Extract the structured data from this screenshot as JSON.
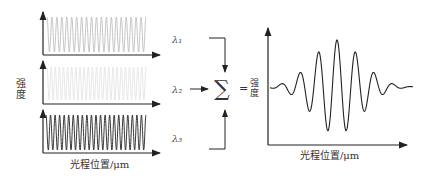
{
  "left_panels": {
    "y_label": "强度",
    "x_label": "光程位置/μm",
    "panels": [
      {
        "name": "wavelength-1",
        "color": "#b8b8b8",
        "cycles": 20
      },
      {
        "name": "wavelength-2",
        "color": "#e2e2e2",
        "cycles": 24
      },
      {
        "name": "wavelength-3",
        "color": "#222222",
        "cycles": 22
      }
    ]
  },
  "wavelength_labels": [
    "λ₁",
    "λ₂",
    "λ₃"
  ],
  "operator": {
    "sum": "∑",
    "equals": "="
  },
  "result_panel": {
    "y_label": "强度",
    "x_label": "光程位置/μm",
    "description": "White-light interferogram: Gaussian-modulated fringe packet"
  }
}
